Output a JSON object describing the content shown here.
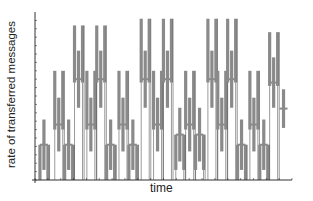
{
  "chart_data": {
    "type": "bar",
    "title": "",
    "xlabel": "time",
    "ylabel": "rate of transferred messages",
    "xlim": [
      0,
      100
    ],
    "ylim": [
      0,
      10
    ],
    "grid": false,
    "legend": "none",
    "x_ticks_labeled": false,
    "y_ticks_labeled": false,
    "note": "Schematic chart without numeric tick labels; values are in arbitrary units read relative to axis extent. Each glyph is a pair of outer bars with a shifted middle bar.",
    "glyphs": [
      {
        "t": 2,
        "outer": [
          0.0,
          2.1
        ],
        "middle": [
          0.6,
          3.6
        ]
      },
      {
        "t": 8,
        "outer": [
          3.0,
          6.5
        ],
        "middle": [
          1.7,
          4.9
        ]
      },
      {
        "t": 12,
        "outer": [
          0.0,
          2.1
        ],
        "middle": [
          0.6,
          3.6
        ]
      },
      {
        "t": 16,
        "outer": [
          5.8,
          9.2
        ],
        "middle": [
          4.3,
          7.7
        ]
      },
      {
        "t": 21,
        "outer": [
          3.0,
          6.5
        ],
        "middle": [
          1.7,
          4.9
        ]
      },
      {
        "t": 25,
        "outer": [
          5.8,
          9.2
        ],
        "middle": [
          4.3,
          7.7
        ]
      },
      {
        "t": 29,
        "outer": [
          0.0,
          2.1
        ],
        "middle": [
          0.6,
          3.6
        ]
      },
      {
        "t": 34,
        "outer": [
          3.0,
          6.5
        ],
        "middle": [
          1.7,
          4.9
        ]
      },
      {
        "t": 38,
        "outer": [
          0.0,
          2.1
        ],
        "middle": [
          0.6,
          3.6
        ]
      },
      {
        "t": 43,
        "outer": [
          5.8,
          9.6
        ],
        "middle": [
          4.3,
          7.7
        ]
      },
      {
        "t": 48,
        "outer": [
          3.0,
          6.5
        ],
        "middle": [
          1.7,
          4.9
        ]
      },
      {
        "t": 52,
        "outer": [
          5.8,
          9.6
        ],
        "middle": [
          4.3,
          7.7
        ]
      },
      {
        "t": 57,
        "outer": [
          0.6,
          2.7
        ],
        "middle": [
          1.1,
          4.3
        ]
      },
      {
        "t": 61,
        "outer": [
          3.0,
          6.5
        ],
        "middle": [
          1.7,
          4.9
        ]
      },
      {
        "t": 65,
        "outer": [
          0.6,
          2.7
        ],
        "middle": [
          1.1,
          4.3
        ]
      },
      {
        "t": 70,
        "outer": [
          5.8,
          9.6
        ],
        "middle": [
          4.3,
          7.7
        ]
      },
      {
        "t": 74,
        "outer": [
          3.0,
          6.5
        ],
        "middle": [
          1.7,
          4.9
        ]
      },
      {
        "t": 78,
        "outer": [
          5.8,
          9.6
        ],
        "middle": [
          4.3,
          7.7
        ]
      },
      {
        "t": 82,
        "outer": [
          0.0,
          2.1
        ],
        "middle": [
          0.6,
          3.6
        ]
      },
      {
        "t": 87,
        "outer": [
          3.0,
          6.5
        ],
        "middle": [
          1.7,
          4.9
        ]
      },
      {
        "t": 91,
        "outer": [
          0.0,
          2.1
        ],
        "middle": [
          0.6,
          3.6
        ]
      },
      {
        "t": 95,
        "outer": [
          5.6,
          8.8
        ],
        "middle": [
          4.3,
          7.3
        ]
      },
      {
        "t": 99,
        "outer": null,
        "middle": [
          3.1,
          5.4
        ]
      }
    ]
  },
  "colors": {
    "bar": "#8a8a8a",
    "line": "#555555",
    "axis": "#333333"
  }
}
